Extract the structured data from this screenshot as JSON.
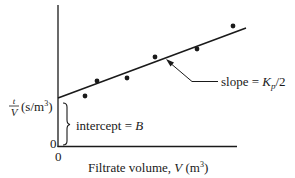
{
  "diagram": {
    "type": "filtration-plot",
    "y_axis": {
      "label_fraction_num": "t",
      "label_fraction_den": "V",
      "label_units": "(s/m",
      "label_units_sup": "3",
      "label_units_close": ")",
      "origin_tick": "0"
    },
    "x_axis": {
      "label_text": "Filtrate volume, ",
      "label_var": "V",
      "label_units": " (m",
      "label_units_sup": "3",
      "label_units_close": ")",
      "origin_tick": "0"
    },
    "annotations": {
      "slope_prefix": "slope = ",
      "slope_var": "K",
      "slope_sub": "p",
      "slope_suffix": "/2",
      "intercept_prefix": "intercept = ",
      "intercept_var": "B"
    },
    "data_points": [
      {
        "x": 85,
        "y": 96
      },
      {
        "x": 97,
        "y": 81
      },
      {
        "x": 127,
        "y": 78
      },
      {
        "x": 155,
        "y": 57
      },
      {
        "x": 197,
        "y": 49
      },
      {
        "x": 233,
        "y": 26
      }
    ],
    "colors": {
      "ink": "#1a1a1a",
      "background": "#ffffff"
    }
  }
}
